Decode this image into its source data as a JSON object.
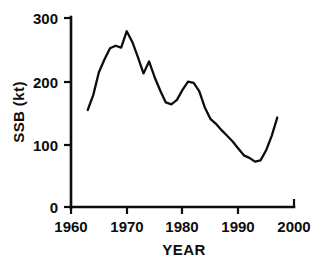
{
  "chart_data": {
    "type": "line",
    "title": "",
    "subtitle": "",
    "xlabel": "YEAR",
    "ylabel": "SSB (kt)",
    "xlim": [
      1960,
      2000
    ],
    "ylim": [
      0,
      300
    ],
    "xticks": [
      1960,
      1970,
      1980,
      1990,
      2000
    ],
    "yticks": [
      0,
      100,
      200,
      300
    ],
    "xtick_labels": [
      "1960",
      "1970",
      "1980",
      "1990",
      "2000"
    ],
    "ytick_labels": [
      "0",
      "100",
      "200",
      "300"
    ],
    "grid": false,
    "legend": null,
    "annotations": [],
    "line_color": "#0d0d0d",
    "series": [
      {
        "name": "SSB",
        "x": [
          1963,
          1964,
          1965,
          1966,
          1967,
          1968,
          1969,
          1970,
          1971,
          1972,
          1973,
          1974,
          1975,
          1976,
          1977,
          1978,
          1979,
          1980,
          1981,
          1982,
          1983,
          1984,
          1985,
          1986,
          1987,
          1988,
          1989,
          1990,
          1991,
          1992,
          1993,
          1994,
          1995,
          1996,
          1997
        ],
        "y": [
          154,
          178,
          214,
          234,
          252,
          256,
          253,
          279,
          262,
          238,
          212,
          231,
          206,
          185,
          166,
          163,
          170,
          186,
          199,
          197,
          184,
          158,
          140,
          132,
          122,
          113,
          104,
          93,
          82,
          78,
          72,
          74,
          90,
          113,
          142
        ]
      }
    ]
  },
  "axes": {
    "y_axis_label": "SSB (kt)",
    "x_axis_label": "YEAR"
  },
  "labels": {
    "y_300": "300",
    "y_200": "200",
    "y_100": "100",
    "y_0": "0",
    "x_1960": "1960",
    "x_1970": "1970",
    "x_1980": "1980",
    "x_1990": "1990",
    "x_2000": "2000"
  }
}
